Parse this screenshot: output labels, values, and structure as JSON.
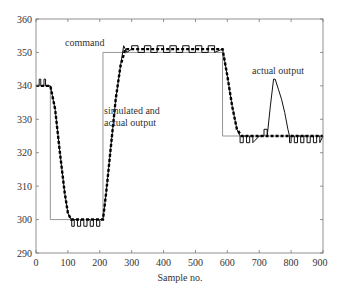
{
  "chart_data": {
    "type": "line",
    "title": "",
    "xlabel": "Sample no.",
    "ylabel": "",
    "xlim": [
      0,
      900
    ],
    "ylim": [
      290,
      360
    ],
    "xticks": [
      0,
      100,
      200,
      300,
      400,
      500,
      600,
      700,
      800,
      900
    ],
    "yticks": [
      290,
      300,
      310,
      320,
      330,
      340,
      350,
      360
    ],
    "grid": false,
    "legend": null,
    "annotations": [
      {
        "text": "command",
        "x": 150,
        "y": 352.5
      },
      {
        "text": "simulated and",
        "x": 210,
        "y": 333
      },
      {
        "text": "actual output",
        "x": 210,
        "y": 330
      },
      {
        "text": "actual output",
        "x": 690,
        "y": 343.5
      }
    ],
    "series": [
      {
        "name": "command",
        "style": "thin solid gray",
        "x": [
          0,
          45,
          45,
          210,
          210,
          585,
          585,
          900
        ],
        "y": [
          340,
          340,
          300,
          300,
          350,
          350,
          325,
          325
        ]
      },
      {
        "name": "simulated output",
        "style": "thick dashed black",
        "x": [
          0,
          45,
          60,
          75,
          90,
          100,
          110,
          210,
          220,
          235,
          250,
          265,
          280,
          300,
          585,
          600,
          615,
          630,
          645,
          900
        ],
        "y": [
          340,
          340,
          333,
          320,
          308,
          302,
          300,
          300,
          308,
          322,
          336,
          346,
          351,
          351,
          351,
          343,
          334,
          327,
          325,
          325
        ]
      },
      {
        "name": "actual output",
        "style": "solid black, quantized noise",
        "x": [
          0,
          10,
          10,
          15,
          15,
          25,
          25,
          30,
          30,
          45,
          60,
          75,
          90,
          100,
          110,
          112,
          112,
          120,
          120,
          130,
          130,
          140,
          140,
          150,
          150,
          160,
          160,
          170,
          170,
          180,
          180,
          190,
          190,
          200,
          200,
          210,
          220,
          235,
          250,
          265,
          275,
          275,
          285,
          285,
          300,
          300,
          320,
          320,
          340,
          340,
          360,
          360,
          380,
          380,
          400,
          400,
          420,
          420,
          440,
          440,
          460,
          460,
          480,
          480,
          500,
          500,
          520,
          520,
          540,
          540,
          560,
          560,
          585,
          600,
          615,
          630,
          640,
          640,
          650,
          650,
          660,
          660,
          670,
          670,
          680,
          680,
          700,
          715,
          715,
          725,
          725,
          735,
          745,
          750,
          760,
          770,
          780,
          790,
          795,
          795,
          800,
          800,
          810,
          810,
          820,
          820,
          830,
          830,
          840,
          840,
          850,
          850,
          860,
          860,
          870,
          870,
          880,
          880,
          890,
          890,
          900
        ],
        "y": [
          340,
          340,
          342,
          342,
          340,
          340,
          342,
          342,
          340,
          340,
          333,
          320,
          308,
          302,
          300,
          300,
          298,
          298,
          300,
          300,
          298,
          298,
          300,
          300,
          298,
          298,
          300,
          300,
          298,
          298,
          300,
          300,
          298,
          298,
          300,
          300,
          308,
          322,
          336,
          346,
          352,
          352,
          350,
          350,
          351,
          352,
          352,
          350,
          350,
          352,
          352,
          350,
          350,
          352,
          352,
          350,
          350,
          352,
          352,
          350,
          350,
          352,
          352,
          350,
          350,
          352,
          352,
          350,
          350,
          352,
          352,
          350,
          351,
          343,
          334,
          327,
          325,
          323,
          323,
          325,
          325,
          323,
          323,
          325,
          325,
          323,
          325,
          325,
          327,
          327,
          325,
          334,
          342,
          342,
          339,
          336,
          332,
          327,
          325,
          323,
          323,
          325,
          325,
          323,
          323,
          325,
          325,
          323,
          323,
          325,
          325,
          323,
          323,
          325,
          325,
          323,
          323,
          325,
          325,
          323,
          325
        ]
      }
    ]
  },
  "figure": {
    "xlabel": "Sample no.",
    "xtick_labels": [
      "0",
      "100",
      "200",
      "300",
      "400",
      "500",
      "600",
      "700",
      "800",
      "900"
    ],
    "ytick_labels": [
      "290",
      "300",
      "310",
      "320",
      "330",
      "340",
      "350",
      "360"
    ],
    "annotation_command": "command",
    "annotation_sim_line1": "simulated and",
    "annotation_sim_line2": "actual output",
    "annotation_actual": "actual output"
  }
}
